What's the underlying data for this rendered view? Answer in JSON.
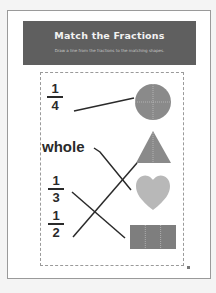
{
  "worksheet": {
    "title": "Match the Fractions",
    "instructions": "Draw a line from the fractions to the matching shapes.",
    "labels": [
      {
        "id": "one-quarter",
        "type": "fraction",
        "numerator": "1",
        "denominator": "4"
      },
      {
        "id": "whole",
        "type": "word",
        "text": "whole"
      },
      {
        "id": "one-third",
        "type": "fraction",
        "numerator": "1",
        "denominator": "3"
      },
      {
        "id": "one-half",
        "type": "fraction",
        "numerator": "1",
        "denominator": "2"
      }
    ],
    "shapes": [
      {
        "id": "circle",
        "shape": "circle divided into 4 parts",
        "color": "#8a8a8a"
      },
      {
        "id": "triangle",
        "shape": "triangle divided into 2 parts",
        "color": "#8a8a8a"
      },
      {
        "id": "heart",
        "shape": "whole heart",
        "color": "#b8b8b8"
      },
      {
        "id": "rectangle",
        "shape": "rectangle divided into 3 parts",
        "color": "#7e7e7e"
      }
    ],
    "matches": [
      {
        "from": "1/4",
        "to": "circle"
      },
      {
        "from": "whole",
        "to": "heart"
      },
      {
        "from": "1/3",
        "to": "rectangle"
      },
      {
        "from": "1/2",
        "to": "triangle"
      }
    ]
  },
  "colors": {
    "header_bg": "#5f5f5f",
    "line": "#2a2a2a"
  }
}
